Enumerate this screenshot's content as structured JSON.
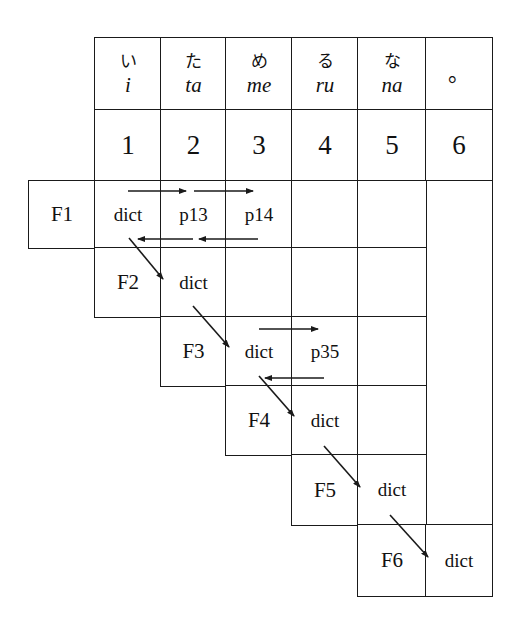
{
  "header": {
    "columns": [
      {
        "kana": "い",
        "romaji": "i"
      },
      {
        "kana": "た",
        "romaji": "ta"
      },
      {
        "kana": "め",
        "romaji": "me"
      },
      {
        "kana": "る",
        "romaji": "ru"
      },
      {
        "kana": "な",
        "romaji": "na"
      },
      {
        "kana": "",
        "romaji": "。"
      }
    ],
    "indices": [
      "1",
      "2",
      "3",
      "4",
      "5",
      "6"
    ]
  },
  "rows": [
    {
      "label": "F1",
      "cells": [
        "dict",
        "p13",
        "p14",
        "",
        ""
      ]
    },
    {
      "label": "F2",
      "cells": [
        "dict",
        "",
        "",
        ""
      ]
    },
    {
      "label": "F3",
      "cells": [
        "dict",
        "p35",
        ""
      ]
    },
    {
      "label": "F4",
      "cells": [
        "dict",
        ""
      ]
    },
    {
      "label": "F5",
      "cells": [
        "dict"
      ]
    },
    {
      "label": "F6",
      "cells": [
        "dict"
      ]
    }
  ],
  "colors": {
    "line": "#1a1a1a",
    "background": "#ffffff"
  }
}
